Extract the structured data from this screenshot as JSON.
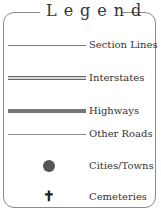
{
  "legend": {
    "title": "Legend",
    "items": [
      {
        "label": "Section Lines",
        "symbol": "thin-line",
        "color": "#7a7a7a"
      },
      {
        "label": "Interstates",
        "symbol": "double-line",
        "color": "#666666"
      },
      {
        "label": "Highways",
        "symbol": "thick-line",
        "color": "#777777"
      },
      {
        "label": "Other Roads",
        "symbol": "thin-line",
        "color": "#8c8c8c"
      },
      {
        "label": "Cities/Towns",
        "symbol": "dot-icon",
        "color": "#555555"
      },
      {
        "label": "Cemeteries",
        "symbol": "cross-icon",
        "glyph": "✝",
        "color": "#222222"
      }
    ]
  }
}
